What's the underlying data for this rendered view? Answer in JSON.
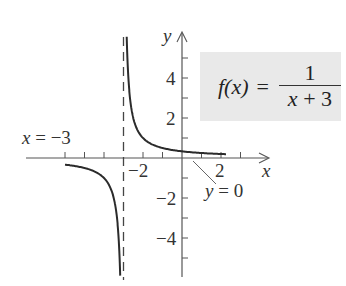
{
  "chart_data": {
    "type": "line",
    "title": "",
    "function": "f(x) = 1/(x+3)",
    "xlabel": "x",
    "ylabel": "y",
    "xlim": [
      -7,
      4.5
    ],
    "ylim": [
      -6,
      6.3
    ],
    "grid": false,
    "x_ticks": [
      -6,
      -5,
      -4,
      -3,
      -2,
      -1,
      1,
      2,
      3
    ],
    "x_tick_labels": {
      "-2": "−2",
      "2": "2"
    },
    "y_ticks": [
      -5,
      -4,
      -3,
      -2,
      -1,
      1,
      2,
      3,
      4,
      5
    ],
    "y_tick_labels": {
      "4": "4",
      "2": "2",
      "-2": "−2",
      "-4": "−4"
    },
    "series": [
      {
        "name": "right-branch",
        "x": [
          -2.83,
          -2.75,
          -2.5,
          -2,
          -1.5,
          -1,
          0,
          1,
          2,
          2.3
        ],
        "y": [
          5.9,
          4,
          2,
          1,
          0.67,
          0.5,
          0.33,
          0.25,
          0.2,
          0.19
        ]
      },
      {
        "name": "left-branch",
        "x": [
          -6,
          -5,
          -4,
          -3.5,
          -3.25,
          -3.17
        ],
        "y": [
          -0.33,
          -0.5,
          -1,
          -2,
          -4,
          -5.9
        ]
      }
    ],
    "asymptotes": [
      {
        "type": "vertical",
        "x": -3,
        "label": "x = −3",
        "style": "dashed"
      },
      {
        "type": "horizontal",
        "y": 0,
        "label": "y = 0"
      }
    ]
  },
  "labels": {
    "formula_lhs": "f(x)",
    "formula_eq": "=",
    "formula_num": "1",
    "formula_den_x": "x",
    "formula_den_plus": " + 3",
    "vert_asym_x": "x",
    "vert_asym_rest": " = −3",
    "horiz_asym_y": "y",
    "horiz_asym_rest": " = 0",
    "x_axis": "x",
    "y_axis": "y",
    "tick_y4": "4",
    "tick_y2": "2",
    "tick_yn2": "−2",
    "tick_yn4": "−4",
    "tick_xn2": "−2",
    "tick_x2": "2"
  },
  "colors": {
    "curve": "#2b2b2b",
    "axis": "#555555",
    "formula_bg": "#e9e9e9"
  }
}
